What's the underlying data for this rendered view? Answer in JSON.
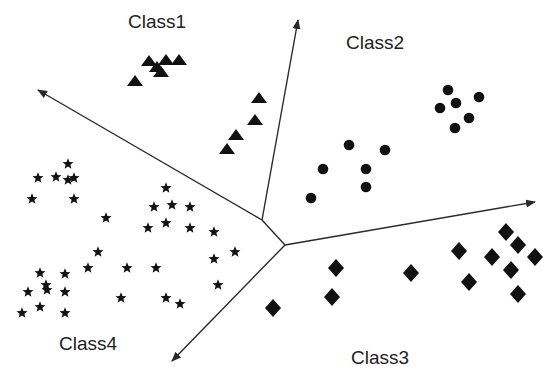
{
  "colors": {
    "background": "#ffffff",
    "ink": "#111111",
    "line": "#2a2a2a",
    "label": "#222222"
  },
  "labels": [
    {
      "id": "class1",
      "text": "Class1",
      "x": 128,
      "y": 12
    },
    {
      "id": "class2",
      "text": "Class2",
      "x": 346,
      "y": 33
    },
    {
      "id": "class3",
      "text": "Class3",
      "x": 351,
      "y": 348
    },
    {
      "id": "class4",
      "text": "Class4",
      "x": 59,
      "y": 334
    }
  ],
  "junctions": {
    "upper": [
      262,
      220
    ],
    "lower": [
      285,
      245
    ]
  },
  "boundaries": [
    {
      "id": "arrow-upper-left",
      "from": "upper",
      "to": [
        38,
        90
      ]
    },
    {
      "id": "arrow-up",
      "from": "upper",
      "to": [
        298,
        20
      ]
    },
    {
      "id": "junction-link",
      "from": "upper",
      "to_junction": "lower"
    },
    {
      "id": "arrow-right",
      "from": "lower",
      "to": [
        535,
        202
      ]
    },
    {
      "id": "arrow-down-left",
      "from": "lower",
      "to": [
        172,
        361
      ]
    }
  ],
  "classes": [
    {
      "name": "Class1",
      "marker": "triangle",
      "points": [
        [
          149,
          61
        ],
        [
          166,
          60
        ],
        [
          179,
          60
        ],
        [
          157,
          67
        ],
        [
          161,
          72
        ],
        [
          135,
          81
        ],
        [
          259,
          98
        ],
        [
          255,
          120
        ],
        [
          236,
          135
        ],
        [
          227,
          149
        ]
      ]
    },
    {
      "name": "Class2",
      "marker": "circle",
      "points": [
        [
          448,
          90
        ],
        [
          456,
          103
        ],
        [
          479,
          97
        ],
        [
          440,
          108
        ],
        [
          469,
          118
        ],
        [
          455,
          128
        ],
        [
          349,
          145
        ],
        [
          385,
          150
        ],
        [
          323,
          169
        ],
        [
          366,
          169
        ],
        [
          366,
          187
        ],
        [
          311,
          198
        ]
      ]
    },
    {
      "name": "Class3",
      "marker": "diamond",
      "points": [
        [
          506,
          232
        ],
        [
          518,
          245
        ],
        [
          459,
          251
        ],
        [
          492,
          257
        ],
        [
          535,
          257
        ],
        [
          511,
          270
        ],
        [
          469,
          282
        ],
        [
          518,
          294
        ],
        [
          336,
          268
        ],
        [
          332,
          297
        ],
        [
          411,
          273
        ],
        [
          273,
          308
        ]
      ]
    },
    {
      "name": "Class4",
      "marker": "star",
      "points": [
        [
          68,
          164
        ],
        [
          38,
          178
        ],
        [
          56,
          177
        ],
        [
          68,
          180
        ],
        [
          74,
          178
        ],
        [
          32,
          199
        ],
        [
          74,
          199
        ],
        [
          166,
          188
        ],
        [
          154,
          207
        ],
        [
          172,
          205
        ],
        [
          190,
          207
        ],
        [
          106,
          218
        ],
        [
          148,
          228
        ],
        [
          166,
          223
        ],
        [
          190,
          228
        ],
        [
          214,
          232
        ],
        [
          98,
          252
        ],
        [
          214,
          259
        ],
        [
          235,
          252
        ],
        [
          127,
          268
        ],
        [
          156,
          268
        ],
        [
          218,
          285
        ],
        [
          121,
          298
        ],
        [
          166,
          298
        ],
        [
          180,
          304
        ],
        [
          88,
          268
        ],
        [
          40,
          273
        ],
        [
          65,
          274
        ],
        [
          46,
          285
        ],
        [
          47,
          290
        ],
        [
          28,
          292
        ],
        [
          65,
          292
        ],
        [
          40,
          307
        ],
        [
          22,
          313
        ],
        [
          65,
          313
        ]
      ]
    }
  ]
}
